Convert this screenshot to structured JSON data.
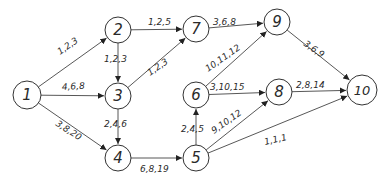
{
  "diagram": {
    "type": "network-graph",
    "colors": {
      "stroke": "#333333",
      "text": "#2a2a2a",
      "background": "#ffffff"
    },
    "nodes": [
      {
        "id": "1",
        "label": "1",
        "x": 27,
        "y": 95,
        "r": 14
      },
      {
        "id": "2",
        "label": "2",
        "x": 118,
        "y": 30,
        "r": 13
      },
      {
        "id": "3",
        "label": "3",
        "x": 118,
        "y": 96,
        "r": 13
      },
      {
        "id": "4",
        "label": "4",
        "x": 118,
        "y": 158,
        "r": 13
      },
      {
        "id": "5",
        "label": "5",
        "x": 196,
        "y": 158,
        "r": 13
      },
      {
        "id": "6",
        "label": "6",
        "x": 196,
        "y": 95,
        "r": 13
      },
      {
        "id": "7",
        "label": "7",
        "x": 196,
        "y": 29,
        "r": 13
      },
      {
        "id": "8",
        "label": "8",
        "x": 279,
        "y": 92,
        "r": 13
      },
      {
        "id": "9",
        "label": "9",
        "x": 277,
        "y": 22,
        "r": 13
      },
      {
        "id": "10",
        "label": "10",
        "x": 362,
        "y": 90,
        "r": 15
      }
    ],
    "edges": [
      {
        "from": "1",
        "to": "2",
        "label": "1,2,3",
        "lx": 60,
        "ly": 55,
        "rot": -35
      },
      {
        "from": "1",
        "to": "3",
        "label": "4,6,8",
        "lx": 62,
        "ly": 90,
        "rot": -3
      },
      {
        "from": "1",
        "to": "4",
        "label": "3,8,20",
        "lx": 55,
        "ly": 125,
        "rot": 33
      },
      {
        "from": "2",
        "to": "7",
        "label": "1,2,5",
        "lx": 148,
        "ly": 25,
        "rot": 0
      },
      {
        "from": "2",
        "to": "3",
        "label": "1,2,3",
        "lx": 104,
        "ly": 62,
        "rot": 0
      },
      {
        "from": "3",
        "to": "7",
        "label": "1,2,3",
        "lx": 150,
        "ly": 76,
        "rot": -35
      },
      {
        "from": "3",
        "to": "4",
        "label": "2,4,6",
        "lx": 104,
        "ly": 127,
        "rot": 0
      },
      {
        "from": "4",
        "to": "5",
        "label": "6,8,19",
        "lx": 140,
        "ly": 172,
        "rot": 0
      },
      {
        "from": "5",
        "to": "6",
        "label": "2,4,5",
        "lx": 181,
        "ly": 132,
        "rot": 0
      },
      {
        "from": "6",
        "to": "9",
        "label": "10,11,12",
        "lx": 208,
        "ly": 72,
        "rot": -35
      },
      {
        "from": "6",
        "to": "8",
        "label": "3,10,15",
        "lx": 210,
        "ly": 90,
        "rot": 0
      },
      {
        "from": "7",
        "to": "9",
        "label": "3,6,8",
        "lx": 213,
        "ly": 25,
        "rot": 0
      },
      {
        "from": "5",
        "to": "8",
        "label": "9,10,12",
        "lx": 214,
        "ly": 134,
        "rot": -35
      },
      {
        "from": "5",
        "to": "10",
        "label": "1,1,1",
        "lx": 265,
        "ly": 145,
        "rot": -13
      },
      {
        "from": "8",
        "to": "10",
        "label": "2,8,14",
        "lx": 296,
        "ly": 88,
        "rot": 0
      },
      {
        "from": "9",
        "to": "10",
        "label": "3,6,9",
        "lx": 303,
        "ly": 45,
        "rot": 35
      }
    ]
  }
}
